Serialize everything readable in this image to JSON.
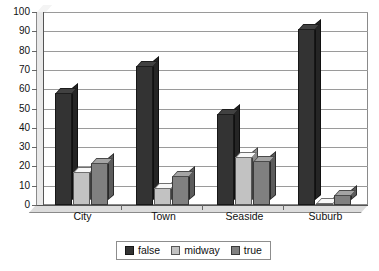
{
  "chart_data": {
    "type": "bar",
    "title": "",
    "subtitle": "",
    "xlabel": "",
    "ylabel": "",
    "categories": [
      "City",
      "Town",
      "Seaside",
      "Suburb"
    ],
    "series": [
      {
        "name": "false",
        "color": "#333333",
        "values": [
          58,
          72,
          47,
          91
        ]
      },
      {
        "name": "midway",
        "color": "#c2c2c2",
        "values": [
          17,
          9,
          25,
          1
        ]
      },
      {
        "name": "true",
        "color": "#808080",
        "values": [
          22,
          15,
          23,
          5
        ]
      }
    ],
    "ylim": [
      0,
      100
    ],
    "ytick_step": 10,
    "yticks": [
      "100",
      "90",
      "80",
      "70",
      "60",
      "50",
      "40",
      "30",
      "20",
      "10",
      "0"
    ],
    "grid": true,
    "grid_axis": "y",
    "legend_position": "bottom",
    "style": "3d-column"
  },
  "colors": {
    "plot_background": "#ffffff",
    "grid": "#9a9a9a",
    "frame": "#8a8a8a",
    "axis": "#555555",
    "floor": "#dcdcdc",
    "wall": "#e9e9e9",
    "text": "#111111"
  }
}
